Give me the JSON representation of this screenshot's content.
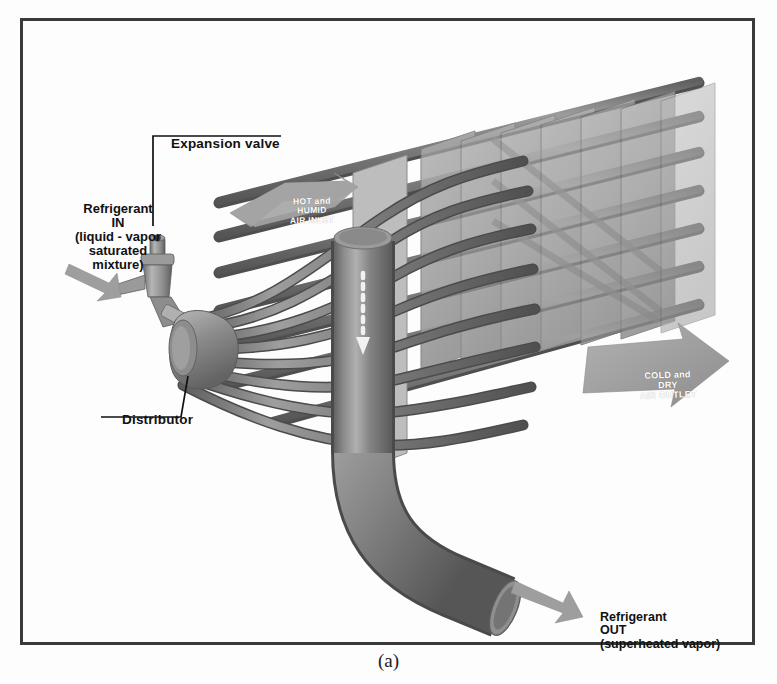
{
  "figure": {
    "caption": "(a)",
    "background_color": "#fdfdfd",
    "frame_color": "#3a3a3a"
  },
  "labels": {
    "expansion_valve": "Expansion valve",
    "refrigerant_in": "Refrigerant\nIN\n(liquid - vapor\nsaturated\nmixture)",
    "distributor": "Distributor",
    "refrigerant_out": "Refrigerant\nOUT\n(superheated vapor)"
  },
  "airflow": {
    "inlet": "HOT and\nHUMID\nAIR INLET",
    "outlet": "COLD and\nDRY\nAIR OUTLET",
    "inlet_arrow_color": "#9a9a9a",
    "outlet_arrow_color": "#9d9d9d",
    "text_color": "#ffffff"
  },
  "components": {
    "expansion_valve_body": "expansion-valve-body",
    "distributor_cone": "distributor-cone",
    "feeder_tubes_count": 8,
    "fin_plates_count": 7,
    "tube_rows_count": 6,
    "header_pipe": "vertical-header-pipe",
    "outlet_bend": "outlet-elbow-pipe",
    "flow_arrow": "dashed-downward-flow-arrow"
  },
  "palette": {
    "tube_dark": "#6e6e6e",
    "tube_mid": "#848484",
    "tube_light": "#a6a6a6",
    "fin_plate": "#b4b4b4",
    "fin_plate_edge": "#8f8f8f",
    "pipe_body": "#7d7d7d",
    "pipe_highlight": "#b8b8b8",
    "valve_body": "#a0a0a0",
    "leader_line": "#111111"
  }
}
